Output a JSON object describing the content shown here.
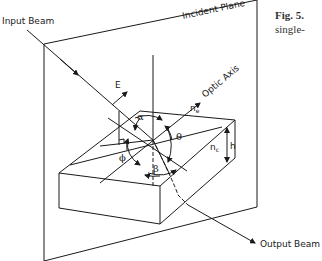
{
  "figure": {
    "caption_label": "Fig. 5.",
    "caption_text": "single-"
  },
  "diagram": {
    "labels": {
      "input_beam": "Input Beam",
      "incident_plane": "Incident Plane",
      "optic_axis": "Optic Axis",
      "output_beam": "Output Beam",
      "field": "E",
      "n_e": "n",
      "n_e_sub": "e",
      "n_c": "n",
      "n_c_sub": "c",
      "height": "h",
      "alpha": "α",
      "theta": "θ",
      "phi": "ϕ",
      "beta": "β"
    },
    "colors": {
      "line": "#1a1a1a",
      "background": "#ffffff"
    }
  }
}
